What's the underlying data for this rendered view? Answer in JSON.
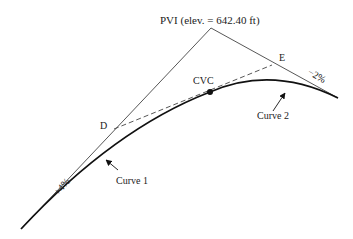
{
  "diagram": {
    "pvi_label": "PVI (elev. = 642.40 ft)",
    "cvc_label": "CVC",
    "point_d_label": "D",
    "point_e_label": "E",
    "grade_left": "+4%",
    "grade_right": "−2%",
    "curve1_label": "Curve 1",
    "curve2_label": "Curve 2",
    "colors": {
      "line": "#333333",
      "curve": "#111111"
    }
  }
}
